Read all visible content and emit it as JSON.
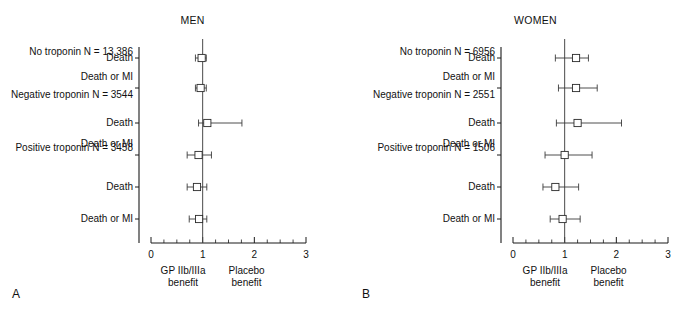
{
  "figure": {
    "background": "#ffffff",
    "marker_color": "#2a2a2a",
    "line_color": "#3a3a3a",
    "axis_color": "#1a1a1a"
  },
  "panels": [
    {
      "letter": "A",
      "title": "MEN",
      "axis": {
        "ticks": [
          "0",
          "1",
          "2",
          "3"
        ],
        "tick_values": [
          0,
          1,
          2,
          3
        ],
        "minor_step": 0.25,
        "xlim": [
          0,
          3
        ],
        "reference": 1
      },
      "caption_left_line1": "GP IIb/IIIa",
      "caption_left_line2": "benefit",
      "caption_right_line1": "Placebo",
      "caption_right_line2": "benefit",
      "group_labels": [
        "No troponin N = 13,386",
        "Negative troponin N = 3544",
        "Positive troponin N = 3458"
      ],
      "rows": [
        {
          "group": "No troponin N = 13,386",
          "outcome": "Death",
          "estimate": 0.98,
          "low": 0.86,
          "high": 1.07
        },
        {
          "group": "No troponin N = 13,386",
          "outcome": "Death or MI",
          "estimate": 0.96,
          "low": 0.86,
          "high": 1.07
        },
        {
          "group": "Negative troponin N = 3544",
          "outcome": "Death",
          "estimate": 1.09,
          "low": 0.92,
          "high": 1.76
        },
        {
          "group": "Negative troponin N = 3544",
          "outcome": "Death or MI",
          "estimate": 0.92,
          "low": 0.7,
          "high": 1.17
        },
        {
          "group": "Positive troponin N = 3458",
          "outcome": "Death",
          "estimate": 0.89,
          "low": 0.7,
          "high": 1.08
        },
        {
          "group": "Positive troponin N = 3458",
          "outcome": "Death or MI",
          "estimate": 0.93,
          "low": 0.74,
          "high": 1.08
        }
      ]
    },
    {
      "letter": "B",
      "title": "WOMEN",
      "axis": {
        "ticks": [
          "0",
          "1",
          "2",
          "3"
        ],
        "tick_values": [
          0,
          1,
          2,
          3
        ],
        "minor_step": 0.25,
        "xlim": [
          0,
          3
        ],
        "reference": 1
      },
      "caption_left_line1": "GP IIb/IIIa",
      "caption_left_line2": "benefit",
      "caption_right_line1": "Placebo",
      "caption_right_line2": "benefit",
      "group_labels": [
        "No troponin N = 6956",
        "Negative troponin N = 2551",
        "Positive troponin N = 1506"
      ],
      "rows": [
        {
          "group": "No troponin N = 6956",
          "outcome": "Death",
          "estimate": 1.22,
          "low": 0.82,
          "high": 1.46
        },
        {
          "group": "No troponin N = 6956",
          "outcome": "Death or MI",
          "estimate": 1.22,
          "low": 0.88,
          "high": 1.63
        },
        {
          "group": "Negative troponin N = 2551",
          "outcome": "Death",
          "estimate": 1.25,
          "low": 0.84,
          "high": 2.1
        },
        {
          "group": "Negative troponin N = 2551",
          "outcome": "Death or MI",
          "estimate": 1.0,
          "low": 0.62,
          "high": 1.53
        },
        {
          "group": "Positive troponin N = 1506",
          "outcome": "Death",
          "estimate": 0.82,
          "low": 0.58,
          "high": 1.27
        },
        {
          "group": "Positive troponin N = 1506",
          "outcome": "Death or MI",
          "estimate": 0.96,
          "low": 0.72,
          "high": 1.3
        }
      ]
    }
  ],
  "chart_data": {
    "type": "scatter",
    "xlabel": "Odds ratio",
    "ylabel": "",
    "xlim": [
      0,
      3
    ],
    "xticks": [
      0,
      1,
      2,
      3
    ],
    "grid": false,
    "legend": "none",
    "reference_line": 1,
    "annotations": [
      "GP IIb/IIIa benefit",
      "Placebo benefit",
      "MEN",
      "WOMEN",
      "A",
      "B"
    ],
    "series": [
      {
        "name": "MEN",
        "categories": [
          "No troponin N = 13,386 — Death",
          "No troponin N = 13,386 — Death or MI",
          "Negative troponin N = 3544 — Death",
          "Negative troponin N = 3544 — Death or MI",
          "Positive troponin N = 3458 — Death",
          "Positive troponin N = 3458 — Death or MI"
        ],
        "values": [
          0.98,
          0.96,
          1.09,
          0.92,
          0.89,
          0.93
        ],
        "ci_low": [
          0.86,
          0.86,
          0.92,
          0.7,
          0.7,
          0.74
        ],
        "ci_high": [
          1.07,
          1.07,
          1.76,
          1.17,
          1.08,
          1.08
        ]
      },
      {
        "name": "WOMEN",
        "categories": [
          "No troponin N = 6956 — Death",
          "No troponin N = 6956 — Death or MI",
          "Negative troponin N = 2551 — Death",
          "Negative troponin N = 2551 — Death or MI",
          "Positive troponin N = 1506 — Death",
          "Positive troponin N = 1506 — Death or MI"
        ],
        "values": [
          1.22,
          1.22,
          1.25,
          1.0,
          0.82,
          0.96
        ],
        "ci_low": [
          0.82,
          0.88,
          0.84,
          0.62,
          0.58,
          0.72
        ],
        "ci_high": [
          1.46,
          1.63,
          2.1,
          1.53,
          1.27,
          1.3
        ]
      }
    ]
  }
}
